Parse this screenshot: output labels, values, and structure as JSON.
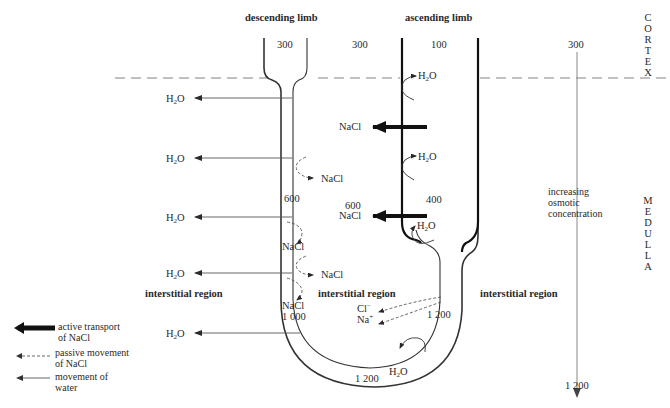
{
  "labels": {
    "descending_limb": "descending limb",
    "ascending_limb": "ascending limb",
    "cortex": "CORTEX",
    "medulla": "MEDULLA",
    "interstitial_left": "interstitial region",
    "interstitial_middle": "interstitial region",
    "interstitial_right": "interstitial region",
    "gradient": [
      "increasing",
      "osmotic",
      "concentration"
    ]
  },
  "concentrations": {
    "descending_top": "300",
    "between_top": "300",
    "ascending_top": "100",
    "interstitial_top": "300",
    "descending_mid": "600",
    "between_mid": "600",
    "ascending_mid": "400",
    "descending_bottom": "1 000",
    "ascending_thin_bottom": "1 200",
    "loop_bottom": "1 200",
    "interstitial_bottom": "1 200"
  },
  "molecules": {
    "water": {
      "main": "H",
      "sub": "2",
      "tail": "O"
    },
    "nacl": "NaCl",
    "chloride": {
      "main": "Cl",
      "sup": "−"
    },
    "sodium": {
      "main": "Na",
      "sup": "+"
    }
  },
  "legend": {
    "items": [
      {
        "icon": "thick-arrow-icon",
        "line1": "active transport",
        "line2": "of NaCl"
      },
      {
        "icon": "dashed-arrow-icon",
        "line1": "passive movement",
        "line2": "of NaCl"
      },
      {
        "icon": "thin-arrow-icon",
        "line1": "movement of",
        "line2": "water"
      }
    ]
  },
  "colors": {
    "ink": "#2a2a2a",
    "thin_line": "#555555",
    "dashed": "#666666",
    "background": "#ffffff"
  }
}
